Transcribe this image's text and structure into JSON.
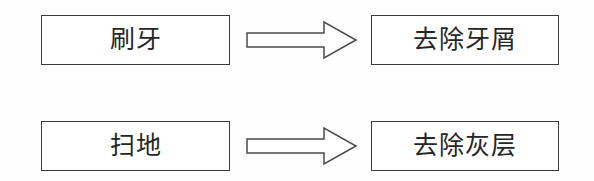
{
  "diagram": {
    "type": "flow-diagram",
    "title": "",
    "background_color": "#ffffff",
    "line_color": "#3a3a3a",
    "text_color": "#262626",
    "rows": [
      {
        "source": "刷牙",
        "arrow": "right-arrow-icon",
        "target": "去除牙屑"
      },
      {
        "source": "扫地",
        "arrow": "right-arrow-icon",
        "target": "去除灰层"
      }
    ]
  }
}
